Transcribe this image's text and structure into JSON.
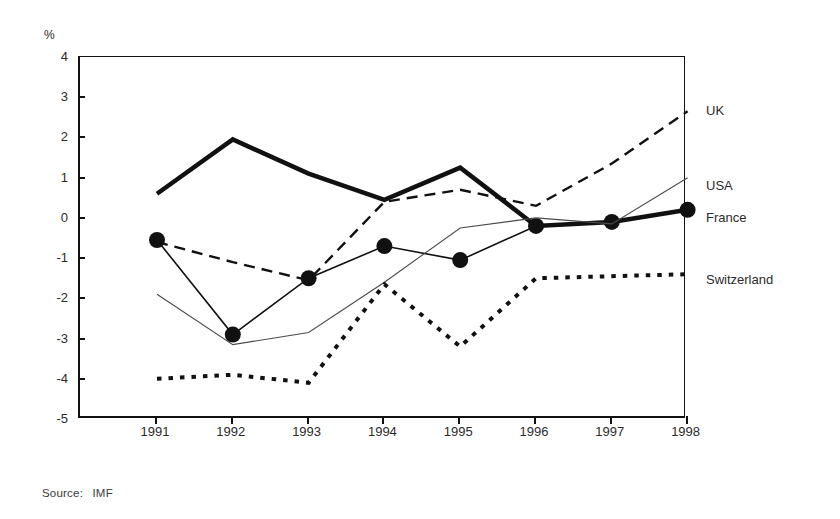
{
  "axis": {
    "unit_label": "%",
    "y_ticks": [
      "4",
      "3",
      "2",
      "1",
      "0",
      "-1",
      "-2",
      "-3",
      "-4",
      "-5"
    ],
    "x_ticks": [
      "1991",
      "1992",
      "1993",
      "1994",
      "1995",
      "1996",
      "1997",
      "1998"
    ]
  },
  "source": {
    "prefix": "Source:",
    "value": "IMF"
  },
  "series_labels": [
    {
      "name": "UK",
      "top": 103
    },
    {
      "name": "USA",
      "top": 178
    },
    {
      "name": "France",
      "top": 210
    },
    {
      "name": "Switzerland",
      "top": 272
    }
  ],
  "chart_data": {
    "type": "line",
    "title": "",
    "xlabel": "",
    "ylabel": "%",
    "ylim": [
      -5,
      4
    ],
    "ytick_step": 1,
    "grid": false,
    "legend_position": "right-inline",
    "categories": [
      "1991",
      "1992",
      "1993",
      "1994",
      "1995",
      "1996",
      "1997",
      "1998"
    ],
    "series": [
      {
        "name": "UK",
        "style": "thick-solid",
        "color": "#111111",
        "width": 4.5,
        "markers": false,
        "values": [
          0.6,
          1.95,
          1.1,
          0.45,
          1.25,
          -0.2,
          -0.1,
          0.2
        ]
      },
      {
        "name": "USA",
        "style": "dashed",
        "color": "#111111",
        "width": 2.4,
        "markers": false,
        "values": [
          -0.6,
          -1.1,
          -1.55,
          0.4,
          0.7,
          0.3,
          1.35,
          2.65
        ]
      },
      {
        "name": "France",
        "style": "thin-solid-markers",
        "color": "#111111",
        "width": 1.6,
        "markers": true,
        "values": [
          -0.55,
          -2.9,
          -1.5,
          -0.7,
          -1.05,
          -0.2,
          -0.1,
          0.2
        ]
      },
      {
        "name": "France-thin-trend",
        "style": "thin-solid",
        "color": "#4a4a4a",
        "width": 1.1,
        "markers": false,
        "values": [
          -1.9,
          -3.15,
          -2.85,
          -1.6,
          -0.25,
          0.0,
          -0.15,
          1.0
        ]
      },
      {
        "name": "Switzerland",
        "style": "thick-dotted",
        "color": "#111111",
        "width": 4.0,
        "markers": false,
        "values": [
          -4.0,
          -3.9,
          -4.1,
          -1.65,
          -3.2,
          -1.5,
          -1.45,
          -1.4
        ]
      }
    ]
  }
}
